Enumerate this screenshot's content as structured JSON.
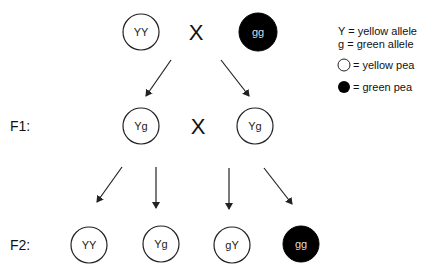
{
  "parents": {
    "left": {
      "genotype": "YY",
      "phenotype": "yellow"
    },
    "cross_symbol": "X",
    "right": {
      "genotype": "gg",
      "phenotype": "green"
    }
  },
  "f1": {
    "label": "F1:",
    "left": {
      "genotype": "Yg",
      "phenotype": "yellow"
    },
    "cross_symbol": "X",
    "right": {
      "genotype": "Yg",
      "phenotype": "yellow"
    }
  },
  "f2": {
    "label": "F2:",
    "offspring": [
      {
        "genotype": "YY",
        "phenotype": "yellow"
      },
      {
        "genotype": "Yg",
        "phenotype": "yellow"
      },
      {
        "genotype": "gY",
        "phenotype": "yellow"
      },
      {
        "genotype": "gg",
        "phenotype": "green"
      }
    ]
  },
  "legend": {
    "line1": "Y = yellow allele",
    "line2": "g = green allele",
    "yellow_pea": "= yellow pea",
    "green_pea": "= green pea"
  },
  "colors": {
    "yellow_fill": "#ffffff",
    "green_fill": "#000000",
    "stroke": "#222222"
  }
}
